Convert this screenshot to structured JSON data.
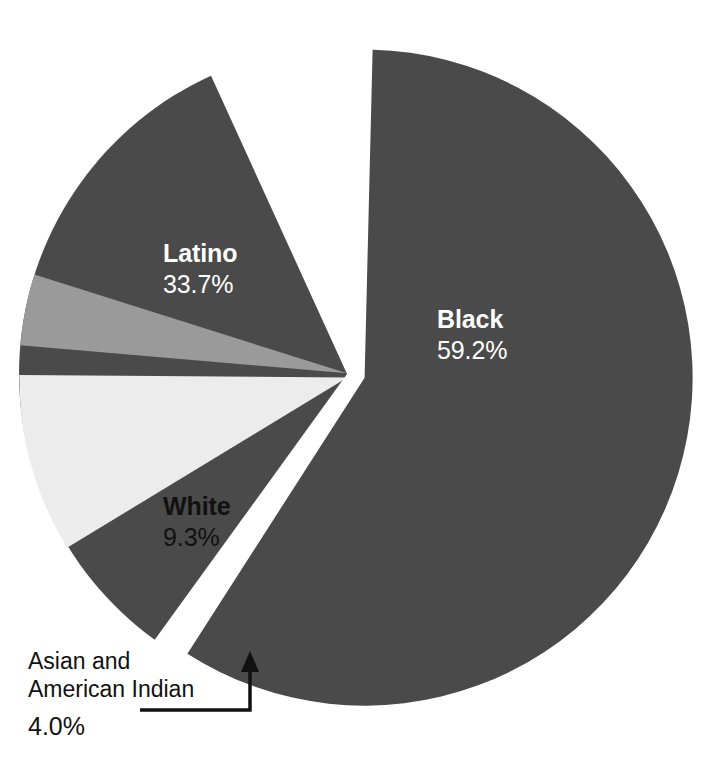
{
  "figure": {
    "background_color": "#ffffff",
    "geometry": {
      "center_x": 356,
      "center_y": 375,
      "radius": 328
    }
  },
  "chart_data": {
    "type": "pie",
    "title": "",
    "subtitle": "",
    "xlabel": "",
    "ylabel": "",
    "grid": false,
    "legend_position": "none",
    "label_style": "inside-slice-with-callout",
    "unit": "%",
    "total": 100.2,
    "categories": [
      "Black",
      "Latino",
      "White",
      "Asian and American Indian"
    ],
    "values": [
      59.2,
      33.7,
      9.3,
      4.0
    ],
    "slices": [
      {
        "label": "Black",
        "value": 59.2,
        "value_text": "59.2%",
        "color": "#4a4a4a",
        "text_color": "#ffffff",
        "label_placement": "inside",
        "start_angle_deg": 0.5,
        "end_angle_deg": 213.6,
        "explode": true
      },
      {
        "label": "Latino",
        "value": 33.7,
        "value_text": "33.7%",
        "color": "#4a4a4a",
        "text_color": "#ffffff",
        "label_placement": "inside",
        "start_angle_deg": 215.0,
        "end_angle_deg": 336.4,
        "explode": true
      },
      {
        "label": "White",
        "value": 9.3,
        "value_text": "9.3%",
        "color": "#ececec",
        "text_color": "#111111",
        "label_placement": "inside",
        "start_angle_deg": 237.8,
        "end_angle_deg": 271.3,
        "explode": true
      },
      {
        "label": "Asian and American Indian",
        "value": 4.0,
        "value_text": "4.0%",
        "color": "#9a9a9a",
        "text_color": "#111111",
        "label_placement": "callout",
        "start_angle_deg": 274.0,
        "end_angle_deg": 288.4,
        "explode": true
      }
    ]
  },
  "labels": {
    "black": {
      "name": "Black",
      "value": "59.2%"
    },
    "latino": {
      "name": "Latino",
      "value": "33.7%"
    },
    "white": {
      "name": "White",
      "value": "9.3%"
    }
  },
  "callout": {
    "line1": "Asian and",
    "line2": "American Indian",
    "value": "4.0%",
    "leader_color": "#111111"
  },
  "colors": {
    "dark_slice": "#4a4a4a",
    "light_slice": "#ececec",
    "mid_slice": "#9a9a9a",
    "background": "#ffffff",
    "text_dark": "#111111",
    "text_light": "#ffffff"
  }
}
